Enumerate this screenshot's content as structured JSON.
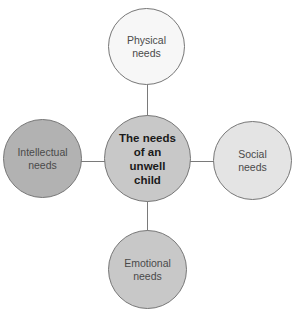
{
  "diagram": {
    "type": "hub-and-spoke",
    "center": {
      "label": "The needs\nof an\nunwell\nchild",
      "fill": "#c8c8c8"
    },
    "nodes": {
      "top": {
        "label": "Physical\nneeds",
        "fill": "#f7f7f7"
      },
      "right": {
        "label": "Social\nneeds",
        "fill": "#e4e4e4"
      },
      "bottom": {
        "label": "Emotional\nneeds",
        "fill": "#c8c8c8"
      },
      "left": {
        "label": "Intellectual\nneeds",
        "fill": "#b2b2b2"
      }
    },
    "stroke_color": "#777777"
  }
}
